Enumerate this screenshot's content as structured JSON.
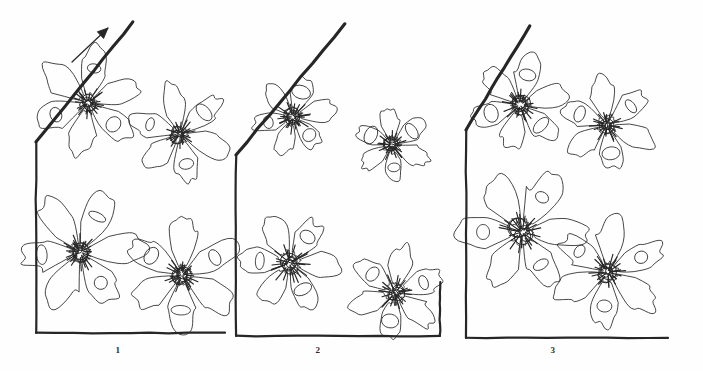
{
  "figure": {
    "kind": "scientific-line-drawing",
    "background_color": "#fefefe",
    "ink_color": "#262626",
    "caption_labels": [
      "1",
      "2",
      "3"
    ],
    "panel_count": 3,
    "structures_per_panel": 4
  },
  "panels": [
    {
      "id": "panel-1",
      "label": "1",
      "label_x": 118,
      "label_y": 345,
      "has_arrow": true,
      "arrow_label": "direction-arrow",
      "frame": {
        "diagonal": [
          [
            133,
            22
          ],
          [
            36,
            142
          ]
        ],
        "left": [
          [
            36,
            142
          ],
          [
            36,
            333
          ]
        ],
        "bottom": [
          [
            36,
            333
          ],
          [
            225,
            333
          ]
        ]
      },
      "rosettes": [
        {
          "name": "rosette-top-left",
          "cx": 88,
          "cy": 103,
          "r": 52,
          "petals": 6,
          "rot": 10,
          "hub": 9
        },
        {
          "name": "rosette-top-right",
          "cx": 180,
          "cy": 134,
          "r": 47,
          "petals": 6,
          "rot": 48,
          "hub": 8
        },
        {
          "name": "rosette-bottom-left",
          "cx": 80,
          "cy": 252,
          "r": 56,
          "petals": 6,
          "rot": 26,
          "hub": 10
        },
        {
          "name": "rosette-bottom-right",
          "cx": 182,
          "cy": 275,
          "r": 52,
          "petals": 6,
          "rot": 62,
          "hub": 9
        }
      ]
    },
    {
      "id": "panel-2",
      "label": "2",
      "label_x": 318,
      "label_y": 345,
      "has_arrow": false,
      "frame": {
        "diagonal": [
          [
            345,
            24
          ],
          [
            236,
            155
          ]
        ],
        "left": [
          [
            236,
            155
          ],
          [
            236,
            336
          ]
        ],
        "bottom": [
          [
            236,
            336
          ],
          [
            440,
            336
          ]
        ],
        "right": [
          [
            440,
            336
          ],
          [
            440,
            282
          ]
        ]
      },
      "rosettes": [
        {
          "name": "rosette-top-left",
          "cx": 293,
          "cy": 117,
          "r": 50,
          "petals": 6,
          "rot": 18,
          "hub": 9
        },
        {
          "name": "rosette-top-right",
          "cx": 392,
          "cy": 145,
          "r": 45,
          "petals": 6,
          "rot": 55,
          "hub": 8
        },
        {
          "name": "rosette-bottom-left",
          "cx": 290,
          "cy": 263,
          "r": 57,
          "petals": 6,
          "rot": 34,
          "hub": 11
        },
        {
          "name": "rosette-bottom-right",
          "cx": 395,
          "cy": 293,
          "r": 54,
          "petals": 6,
          "rot": 70,
          "hub": 10
        }
      ]
    },
    {
      "id": "panel-3",
      "label": "3",
      "label_x": 553,
      "label_y": 345,
      "has_arrow": false,
      "frame": {
        "diagonal": [
          [
            530,
            26
          ],
          [
            466,
            130
          ]
        ],
        "left": [
          [
            466,
            130
          ],
          [
            466,
            338
          ]
        ],
        "bottom": [
          [
            466,
            338
          ],
          [
            668,
            338
          ]
        ]
      },
      "rosettes": [
        {
          "name": "rosette-top-left",
          "cx": 520,
          "cy": 105,
          "r": 50,
          "petals": 6,
          "rot": 14,
          "hub": 9
        },
        {
          "name": "rosette-top-right",
          "cx": 607,
          "cy": 125,
          "r": 48,
          "petals": 6,
          "rot": 52,
          "hub": 9
        },
        {
          "name": "rosette-bottom-left",
          "cx": 522,
          "cy": 232,
          "r": 62,
          "petals": 6,
          "rot": 30,
          "hub": 12
        },
        {
          "name": "rosette-bottom-right",
          "cx": 608,
          "cy": 272,
          "r": 55,
          "petals": 6,
          "rot": 66,
          "hub": 10
        }
      ]
    }
  ],
  "arrow": {
    "name": "direction-arrow",
    "from": [
      72,
      62
    ],
    "to": [
      108,
      28
    ],
    "head_size": 6
  }
}
